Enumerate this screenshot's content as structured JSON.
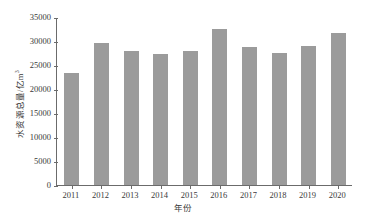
{
  "chart_data": {
    "type": "bar",
    "title": "",
    "xlabel": "年份",
    "ylabel": "水资源总量/亿m³",
    "ylabel_main": "水资源总量/亿m",
    "ylabel_sup": "3",
    "categories": [
      "2011",
      "2012",
      "2013",
      "2014",
      "2015",
      "2016",
      "2017",
      "2018",
      "2019",
      "2020"
    ],
    "values": [
      23257,
      29529,
      27958,
      27267,
      27963,
      32466,
      28761,
      27463,
      29041,
      31605
    ],
    "series": [
      {
        "name": "水资源总量",
        "values": [
          23257,
          29529,
          27958,
          27267,
          27963,
          32466,
          28761,
          27463,
          29041,
          31605
        ]
      }
    ],
    "ylim": [
      0,
      35000
    ],
    "yticks": [
      0,
      5000,
      10000,
      15000,
      20000,
      25000,
      30000,
      35000
    ],
    "ytick_labels": [
      "0",
      "5000",
      "10000",
      "15000",
      "20000",
      "25000",
      "30000",
      "35000"
    ],
    "grid": false,
    "legend": null,
    "bar_color": "#9b9b9b",
    "axis_color": "#6b6b6b",
    "background": "#ffffff"
  }
}
